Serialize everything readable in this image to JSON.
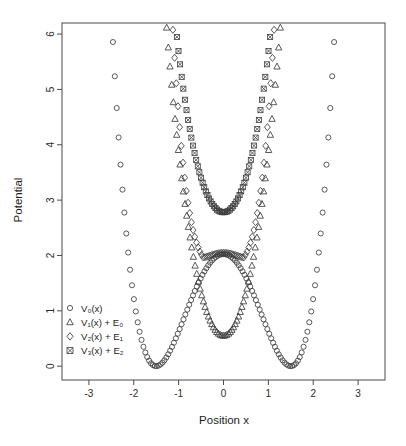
{
  "chart_data": {
    "type": "scatter",
    "title": "",
    "xlabel": "Position x",
    "ylabel": "Potential",
    "xlim": [
      -3.6,
      3.6
    ],
    "ylim": [
      -0.25,
      6.2
    ],
    "xticks": [
      -3,
      -2,
      -1,
      0,
      1,
      2,
      3
    ],
    "xticklabels": [
      "-3",
      "-2",
      "-1",
      "0",
      "1",
      "2",
      "3"
    ],
    "yticks": [
      0,
      1,
      2,
      3,
      4,
      5,
      6
    ],
    "yticklabels": [
      "0",
      "1",
      "2",
      "3",
      "4",
      "5",
      "6"
    ],
    "grid": false,
    "legend_position": "lower-left-inside",
    "marker_color": "#3c3c3c",
    "frame_color": "#4a4a4a",
    "series": [
      {
        "name": "V0(x)",
        "label_main": "V",
        "label_sub": "0",
        "label_tail": "(x)",
        "marker": "circle",
        "description": "double-well potential, minima at x = ±1.5 with value 0, central barrier peak 2.0 at x = 0",
        "model": {
          "kind": "quartic-double-well",
          "a": 0.4,
          "x0": 1.5,
          "offset": 0.0
        },
        "x_range": [
          -2.55,
          2.55
        ],
        "n_points": 120
      },
      {
        "name": "V1(x) + E0",
        "label_main": "V",
        "label_sub": "1",
        "label_tail": "(x) + E",
        "label_tail_sub": "0",
        "marker": "triangle",
        "description": "first SUSY partner potential shifted by ground state energy E0; single well, minimum 0.55 at x = 0",
        "model": {
          "kind": "partner-1",
          "vmin": 0.55,
          "curvature": 3.05
        },
        "x_range": [
          -2.05,
          2.05
        ],
        "n_points": 110
      },
      {
        "name": "V2(x) + E1",
        "label_main": "V",
        "label_sub": "2",
        "label_tail": "(x) + E",
        "label_tail_sub": "1",
        "marker": "diamond",
        "description": "second partner potential shifted by E1; shallow flat-bottom double shoulder, value about 2.0 at x = 0",
        "model": {
          "kind": "partner-2",
          "vcenter": 2.0,
          "dip": 1.9,
          "dipx": 0.45,
          "curvature": 2.6
        },
        "x_range": [
          -1.88,
          1.88
        ],
        "n_points": 100
      },
      {
        "name": "V3(x) + E2",
        "label_main": "V",
        "label_sub": "3",
        "label_tail": "(x) + E",
        "label_tail_sub": "2",
        "marker": "square-x",
        "description": "third partner potential shifted by E2; single broad well, minimum about 2.78 at x = 0",
        "model": {
          "kind": "partner-3",
          "vmin": 2.78,
          "curvature": 2.35
        },
        "x_range": [
          -1.72,
          1.72
        ],
        "n_points": 96
      }
    ]
  },
  "axes": {
    "xlabel": "Position x",
    "ylabel": "Potential"
  },
  "legend": {
    "entries": [
      {
        "marker": "circle",
        "text": "V₀(x)"
      },
      {
        "marker": "triangle",
        "text": "V₁(x) + E₀"
      },
      {
        "marker": "diamond",
        "text": "V₂(x) + E₁"
      },
      {
        "marker": "square-x",
        "text": "V₃(x) + E₂"
      }
    ]
  }
}
